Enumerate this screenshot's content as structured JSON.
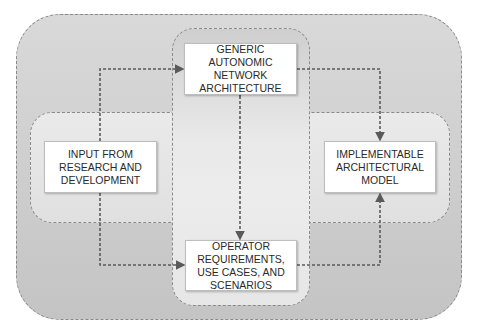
{
  "diagram": {
    "type": "block-flow-diagram",
    "nodes": {
      "generic": {
        "label": "GENERIC\nAUTONOMIC\nNETWORK\nARCHITECTURE"
      },
      "operator": {
        "label": "OPERATOR\nREQUIREMENTS,\nUSE CASES, AND\nSCENARIOS"
      },
      "input": {
        "label": "INPUT FROM\nRESEARCH AND\nDEVELOPMENT"
      },
      "implementable": {
        "label": "IMPLEMENTABLE\nARCHITECTURAL\nMODEL"
      }
    },
    "edges": [
      {
        "from": "input",
        "to": "generic",
        "style": "dashed"
      },
      {
        "from": "input",
        "to": "operator",
        "style": "dashed"
      },
      {
        "from": "generic",
        "to": "implementable",
        "style": "dashed"
      },
      {
        "from": "operator",
        "to": "implementable",
        "style": "dashed"
      },
      {
        "from": "generic",
        "to": "operator",
        "style": "dashed",
        "bidirectional": true
      }
    ],
    "colors": {
      "outer_region": "#cfcfcf",
      "band_region": "#e6e6e6",
      "column_region": "#e8e8e8",
      "box_fill": "#ffffff",
      "arrow": "#5a5a5a",
      "text": "#2a2a2a"
    }
  }
}
